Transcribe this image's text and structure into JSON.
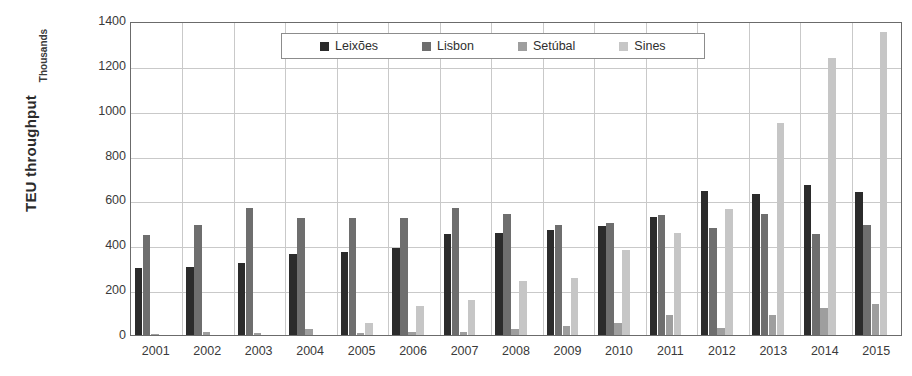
{
  "chart_data": {
    "type": "bar",
    "title": "",
    "xlabel": "",
    "ylabel": "TEU throughput",
    "units_label": "Thousands",
    "ylim": [
      0,
      1400
    ],
    "ytick_step": 200,
    "yticks": [
      0,
      200,
      400,
      600,
      800,
      1000,
      1200,
      1400
    ],
    "grid": true,
    "legend_position": "top-center",
    "categories": [
      "2001",
      "2002",
      "2003",
      "2004",
      "2005",
      "2006",
      "2007",
      "2008",
      "2009",
      "2010",
      "2011",
      "2012",
      "2013",
      "2014",
      "2015"
    ],
    "series": [
      {
        "name": "Leixões",
        "color": "#2b2b2b",
        "values": [
          300,
          305,
          320,
          360,
          370,
          390,
          450,
          453,
          468,
          487,
          525,
          640,
          630,
          668,
          638
        ]
      },
      {
        "name": "Lisbon",
        "color": "#6e6e6e",
        "values": [
          445,
          490,
          565,
          520,
          520,
          520,
          565,
          540,
          490,
          500,
          535,
          475,
          540,
          450,
          492
        ]
      },
      {
        "name": "Setúbal",
        "color": "#9e9e9e",
        "values": [
          3,
          12,
          8,
          28,
          10,
          12,
          12,
          28,
          38,
          55,
          90,
          30,
          90,
          120,
          140
        ]
      },
      {
        "name": "Sines",
        "color": "#c6c6c6",
        "values": [
          0,
          0,
          0,
          0,
          55,
          130,
          158,
          240,
          255,
          380,
          455,
          560,
          945,
          1235,
          1350
        ]
      }
    ]
  },
  "colors": {
    "axis": "#6b6b6b",
    "grid": "#c9c9c9",
    "background": "#ffffff",
    "text": "#333333"
  }
}
